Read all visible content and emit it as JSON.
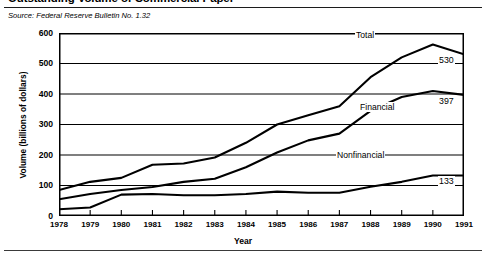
{
  "figure": {
    "title": "Outstanding Volume of Commercial Paper",
    "source": "Source: Federal Reserve Bulletin No. 1.32"
  },
  "chart_data": {
    "type": "line",
    "title": "Outstanding Volume of Commercial Paper",
    "subtitle": "Source: Federal Reserve Bulletin No. 1.32",
    "xlabel": "Year",
    "ylabel": "Volume (billions of dollars)",
    "xlim": [
      1978,
      1991
    ],
    "ylim": [
      0,
      600
    ],
    "yticks": [
      0,
      100,
      200,
      300,
      400,
      500,
      600
    ],
    "xticks": [
      1978,
      1979,
      1980,
      1981,
      1982,
      1983,
      1984,
      1985,
      1986,
      1987,
      1988,
      1989,
      1990,
      1991
    ],
    "grid": "horizontal",
    "legend": "inline-labels",
    "x": [
      1978,
      1979,
      1980,
      1981,
      1982,
      1983,
      1984,
      1985,
      1986,
      1987,
      1988,
      1989,
      1990,
      1991
    ],
    "series": [
      {
        "name": "Total",
        "label_value": "530",
        "values": [
          85,
          112,
          125,
          168,
          172,
          192,
          240,
          300,
          330,
          360,
          455,
          520,
          562,
          530
        ]
      },
      {
        "name": "Financial",
        "label_value": "397",
        "values": [
          55,
          72,
          85,
          95,
          112,
          122,
          160,
          208,
          248,
          270,
          345,
          390,
          410,
          397
        ]
      },
      {
        "name": "Nonfinancial",
        "label_value": "133",
        "values": [
          22,
          28,
          70,
          72,
          68,
          68,
          72,
          80,
          76,
          76,
          96,
          112,
          133,
          133
        ]
      }
    ]
  }
}
